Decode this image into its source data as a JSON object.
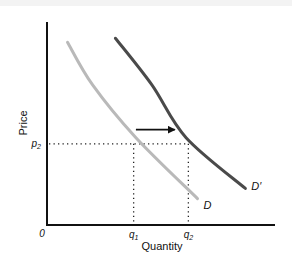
{
  "chart_data": {
    "type": "line",
    "title": "",
    "xlabel": "Quantity",
    "ylabel": "Price",
    "origin_label": "0",
    "xlim": [
      0,
      10
    ],
    "ylim": [
      0,
      10
    ],
    "grid": false,
    "series": [
      {
        "name": "D",
        "label": "D",
        "color": "#b9b9b9",
        "points": [
          [
            0.9,
            9.0
          ],
          [
            2.0,
            6.9
          ],
          [
            3.9,
            4.3
          ],
          [
            6.6,
            1.3
          ]
        ]
      },
      {
        "name": "D'",
        "label": "D′",
        "color": "#4a4a4a",
        "points": [
          [
            3.0,
            9.2
          ],
          [
            4.6,
            6.9
          ],
          [
            6.1,
            4.3
          ],
          [
            8.7,
            1.8
          ]
        ]
      }
    ],
    "reference_lines": {
      "price": {
        "label_main": "p",
        "label_sub": "2",
        "value": 4.0
      },
      "quantities": [
        {
          "label_main": "q",
          "label_sub": "1",
          "value": 3.8
        },
        {
          "label_main": "q",
          "label_sub": "2",
          "value": 6.2
        }
      ]
    },
    "annotations": [
      {
        "type": "arrow",
        "direction": "right",
        "from": [
          3.9,
          4.4
        ],
        "to": [
          5.6,
          4.4
        ],
        "meaning": "demand shift to the right"
      }
    ]
  }
}
